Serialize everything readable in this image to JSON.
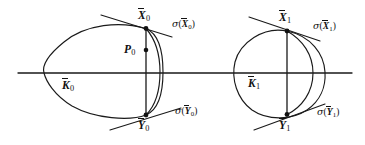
{
  "figure": {
    "kind": "geometry-diagram",
    "background_color": "#ffffff",
    "stroke_color": "#1a1a1a",
    "width": 365,
    "height": 145,
    "axis": {
      "label": "horizontal-axis",
      "x_start": 18,
      "x_end": 352,
      "y": 73
    },
    "labels": {
      "k0": {
        "base": "K",
        "sub": "0",
        "overbar": true,
        "x": 62,
        "y": 80
      },
      "x0": {
        "base": "X",
        "sub": "0",
        "overbar": true,
        "x": 138,
        "y": 10
      },
      "y0": {
        "base": "Y",
        "sub": "0",
        "overbar": true,
        "x": 138,
        "y": 120
      },
      "p0": {
        "base": "P",
        "sub": "0",
        "overbar": false,
        "x": 124,
        "y": 44
      },
      "k1": {
        "base": "K",
        "sub": "1",
        "overbar": true,
        "x": 248,
        "y": 78
      },
      "x1": {
        "base": "X",
        "sub": "1",
        "overbar": true,
        "x": 279,
        "y": 12
      },
      "y1": {
        "base": "Y",
        "sub": "1",
        "overbar": true,
        "x": 279,
        "y": 120
      },
      "sigma_x0": {
        "fn": "σ",
        "base": "X",
        "sub": "0",
        "overbar": true,
        "x": 172,
        "y": 19
      },
      "sigma_y0": {
        "fn": "σ",
        "base": "Y",
        "sub": "0",
        "overbar": true,
        "x": 175,
        "y": 106
      },
      "sigma_x1": {
        "fn": "σ",
        "base": "X",
        "sub": "1",
        "overbar": true,
        "x": 313,
        "y": 21
      },
      "sigma_y1": {
        "fn": "σ",
        "base": "Y",
        "sub": "1",
        "overbar": true,
        "x": 317,
        "y": 107
      }
    },
    "points": [
      {
        "name": "point-x0",
        "x": 146,
        "y": 28.5
      },
      {
        "name": "point-p0",
        "x": 146,
        "y": 50
      },
      {
        "name": "point-y0",
        "x": 146,
        "y": 115
      },
      {
        "name": "point-x1",
        "x": 287,
        "y": 31
      },
      {
        "name": "point-y1",
        "x": 287,
        "y": 114.5
      }
    ],
    "curves": {
      "k0_oval": "M146,28.5 C120,21 86,24 64,42 C48,55 42,66 44,73 C46,81 54,95 72,106 C95,119 130,121 146,115 C160,109 163,90 163,72 C163,52 159,34 146,28.5 Z",
      "k0_inner_arc": "M146,28.5 C156,40 160,54 160,72 C160,92 155,106 146,115",
      "k1_circle": "M287,31 C263,26 240,43 235,62 C231,79 237,99 252,110 C268,121 292,120 307,110 C320,101 326,87 325,72 C324,54 311,36 287,31 Z",
      "k1_inner_arc": "M287,31 C303,40 313,55 313,73 C313,92 302,107 287,114.5",
      "chord_0": "M146,28.5 L146,115",
      "chord_1": "M287,31 L287,114.5",
      "tangent_x0": "M101,15 L172,37",
      "tangent_y0": "M110,130 L181,108",
      "tangent_x1": "M249,17 L320,41",
      "tangent_y1": "M254,130 L325,104"
    }
  }
}
